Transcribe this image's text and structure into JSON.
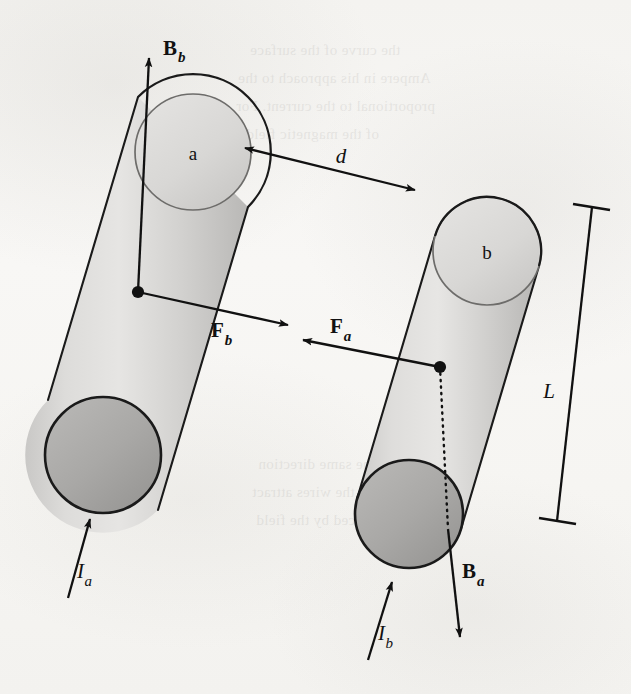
{
  "figure": {
    "kind": "physics-diagram",
    "background_color": "#f7f6f4",
    "ink_color": "#111111"
  },
  "wires": [
    {
      "id": "wire-a",
      "cap_label": "a",
      "current_label_main": "I",
      "current_label_sub": "a",
      "body_fill_light": "#e2e1df",
      "body_fill_mid": "#bdbcba",
      "top_cap_fill": "#d4d3d1",
      "bottom_cap_fill": "#a8a7a5"
    },
    {
      "id": "wire-b",
      "cap_label": "b",
      "current_label_main": "I",
      "current_label_sub": "b",
      "body_fill_light": "#e2e1df",
      "body_fill_mid": "#bdbcba",
      "top_cap_fill": "#d4d3d1",
      "bottom_cap_fill": "#a8a7a5"
    }
  ],
  "vectors": [
    {
      "id": "B-b",
      "main": "B",
      "sub": "b",
      "meaning": "magnetic-field-from-wire-b-at-wire-a",
      "direction": "up"
    },
    {
      "id": "F-b",
      "main": "F",
      "sub": "b",
      "meaning": "force-on-wire-a-from-wire-b",
      "direction": "right"
    },
    {
      "id": "F-a",
      "main": "F",
      "sub": "a",
      "meaning": "force-on-wire-b-from-wire-a",
      "direction": "left"
    },
    {
      "id": "B-a",
      "main": "B",
      "sub": "a",
      "meaning": "magnetic-field-from-wire-a-at-wire-b",
      "direction": "down"
    }
  ],
  "dimensions": [
    {
      "id": "separation",
      "label": "d",
      "meaning": "center-to-center separation between wires",
      "style": "double-headed-arrow"
    },
    {
      "id": "length",
      "label": "L",
      "meaning": "length of wire segment",
      "style": "extension-line-with-end-ticks"
    }
  ],
  "currents": [
    {
      "id": "current-a",
      "main": "I",
      "sub": "a",
      "direction": "up-along-wire-a"
    },
    {
      "id": "current-b",
      "main": "I",
      "sub": "b",
      "direction": "up-along-wire-b"
    }
  ],
  "bleed_through_lines": [
    {
      "text": "the curve of the surface",
      "x": 250,
      "y": 38
    },
    {
      "text": "Ampere in his approach to the",
      "x": 238,
      "y": 66
    },
    {
      "text": "proportional to the current. For",
      "x": 236,
      "y": 94
    },
    {
      "text": "of the magnetic field",
      "x": 246,
      "y": 122
    },
    {
      "text": "in the same direction",
      "x": 258,
      "y": 452
    },
    {
      "text": "then the wires attract",
      "x": 252,
      "y": 480
    },
    {
      "text": "produced by the field",
      "x": 256,
      "y": 508
    }
  ]
}
